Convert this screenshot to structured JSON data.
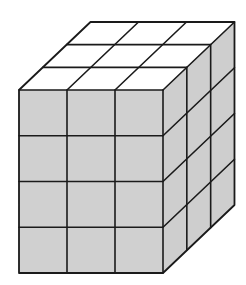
{
  "diagram": {
    "title": "",
    "type": "cube-stack",
    "dimensions": {
      "width_cubes": 3,
      "height_cubes": 4,
      "depth_cubes": 3
    },
    "total_unit_cubes": 36,
    "faces": {
      "top": {
        "color": "#ffffff",
        "grid": "3x3"
      },
      "front": {
        "color": "#d0d0d0",
        "grid": "3x4"
      },
      "side": {
        "color": "#cecece",
        "grid": "3x4"
      }
    },
    "line_color": "#1a1a1a",
    "geometry": {
      "front_left": 19,
      "front_top": 90,
      "cell_width": 48,
      "cell_height": 45.75,
      "depth_dx": 23.83,
      "depth_dy": -22.67
    }
  }
}
